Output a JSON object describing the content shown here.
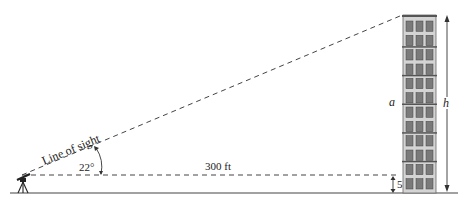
{
  "diagram": {
    "type": "trigonometry-height-of-building",
    "labels": {
      "line_of_sight": "Line of sight",
      "angle": "22°",
      "distance": "300 ft",
      "instrument_height": "5 ft",
      "segment_a": "a",
      "height_h": "h"
    },
    "values": {
      "angle_deg": 22,
      "horizontal_distance_ft": 300,
      "instrument_height_ft": 5
    },
    "building": {
      "columns": 3,
      "window_rows": 12
    },
    "colors": {
      "line": "#333333",
      "building_fill": "#c8c8c8",
      "window_fill": "#7a7a7a",
      "floor_band": "#555555"
    }
  }
}
